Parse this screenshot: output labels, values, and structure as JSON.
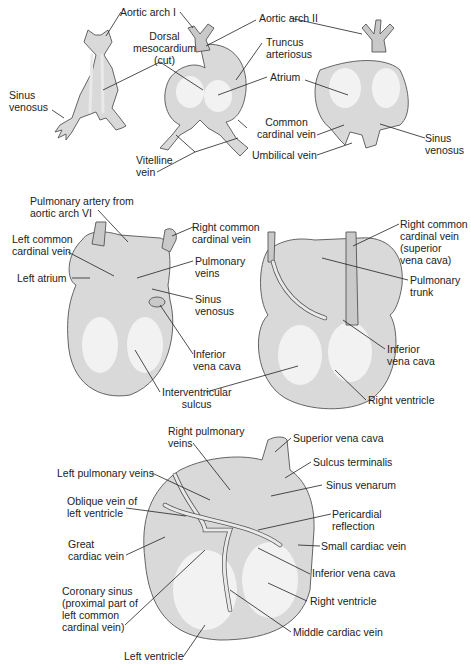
{
  "panels": [
    {
      "id": "early-tubular-heart",
      "labels": {
        "aortic_arch_1": "Aortic arch I",
        "dorsal_mesocardium": "Dorsal\nmesocardium\n(cut)",
        "sinus_venosus_left": "Sinus\nvenosus",
        "vitelline_vein": "Vitelline\nvein",
        "aortic_arch_2": "Aortic arch II",
        "truncus_arteriosus": "Truncus\narteriosus",
        "atrium": "Atrium",
        "common_cardinal_vein": "Common\ncardinal vein",
        "umbilical_vein": "Umbilical vein",
        "sinus_venosus_right": "Sinus\nvenosus"
      }
    },
    {
      "id": "intermediate-heart",
      "labels": {
        "pulmonary_artery": "Pulmonary artery from\naortic arch VI",
        "left_common_cardinal_vein": "Left common\ncardinal vein",
        "left_atrium": "Left atrium",
        "right_common_cardinal_vein": "Right common\ncardinal vein",
        "pulmonary_veins": "Pulmonary\nveins",
        "sinus_venosus": "Sinus\nvenosus",
        "inferior_vena_cava_left": "Inferior\nvena cava",
        "interventricular_sulcus": "Interventricular\nsulcus",
        "right_common_cardinal_vein_svc": "Right common\ncardinal vein\n(superior\nvena cava)",
        "pulmonary_trunk": "Pulmonary\ntrunk",
        "inferior_vena_cava_right": "Inferior\nvena cava",
        "right_ventricle": "Right ventricle"
      }
    },
    {
      "id": "mature-heart-posterior",
      "labels": {
        "right_pulmonary_veins": "Right pulmonary\nveins",
        "left_pulmonary_veins": "Left pulmonary veins",
        "oblique_vein": "Oblique vein of\nleft ventricle",
        "great_cardiac_vein": "Great\ncardiac vein",
        "coronary_sinus": "Coronary sinus\n(proximal part of\nleft common\ncardinal vein)",
        "left_ventricle": "Left ventricle",
        "superior_vena_cava": "Superior vena cava",
        "sulcus_terminalis": "Sulcus terminalis",
        "sinus_venarum": "Sinus venarum",
        "pericardial_reflection": "Pericardial\nreflection",
        "small_cardiac_vein": "Small cardiac vein",
        "inferior_vena_cava": "Inferior vena cava",
        "right_ventricle": "Right ventricle",
        "middle_cardiac_vein": "Middle cardiac vein"
      }
    }
  ]
}
